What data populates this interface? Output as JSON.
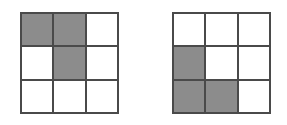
{
  "grids": [
    {
      "id": "left",
      "rows": 3,
      "cols": 3,
      "cells": [
        [
          1,
          1,
          0
        ],
        [
          0,
          1,
          0
        ],
        [
          0,
          0,
          0
        ]
      ]
    },
    {
      "id": "right",
      "rows": 3,
      "cols": 3,
      "cells": [
        [
          0,
          0,
          0
        ],
        [
          1,
          0,
          0
        ],
        [
          1,
          1,
          0
        ]
      ]
    }
  ],
  "colors": {
    "filled": "#8c8c8c",
    "empty": "#ffffff",
    "border": "#4a4a4a"
  }
}
